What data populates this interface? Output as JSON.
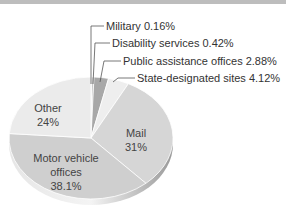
{
  "chart_data": {
    "type": "pie",
    "title": "",
    "style": "3d",
    "slices": [
      {
        "label": "Military",
        "value": 0.16,
        "display": "0.16%",
        "color": "#d9d9d9"
      },
      {
        "label": "Disability services",
        "value": 0.42,
        "display": "0.42%",
        "color": "#bfbfbf"
      },
      {
        "label": "Public assistance offices",
        "value": 2.88,
        "display": "2.88%",
        "color": "#a8a8a8"
      },
      {
        "label": "State-designated sites",
        "value": 4.12,
        "display": "4.12%",
        "color": "#eeeeee"
      },
      {
        "label": "Mail",
        "value": 31,
        "display": "31%",
        "color": "#d6d6d6"
      },
      {
        "label": "Motor vehicle offices",
        "value": 38.1,
        "display": "38.1%",
        "color": "#cfcfcf"
      },
      {
        "label": "Other",
        "value": 24,
        "display": "24%",
        "color": "#ebebeb"
      }
    ],
    "callouts": [
      {
        "text": "Military  0.16%"
      },
      {
        "text": "Disability services  0.42%"
      },
      {
        "text": "Public assistance offices  2.88%"
      },
      {
        "text": "State-designated sites  4.12%"
      }
    ],
    "inside_labels": {
      "other": [
        "Other",
        "24%"
      ],
      "mail": [
        "Mail",
        "31%"
      ],
      "motor": [
        "Motor vehicle",
        "offices",
        "38.1%"
      ]
    }
  }
}
